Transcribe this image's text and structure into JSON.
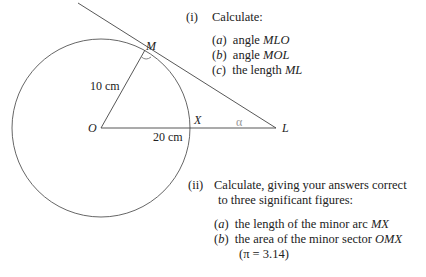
{
  "diagram": {
    "points": {
      "O": "O",
      "M": "M",
      "X": "X",
      "L": "L"
    },
    "labels": {
      "radius": "10 cm",
      "distance_OL": "20 cm",
      "angle_symbol": "α",
      "right_angle_at": "M"
    },
    "given": {
      "radius_cm": 10,
      "OL_cm": 20
    }
  },
  "part_i": {
    "number": "(i)",
    "instruction": "Calculate:",
    "items": [
      {
        "letter": "a",
        "text": "angle ",
        "emph": "MLO"
      },
      {
        "letter": "b",
        "text": "angle ",
        "emph": "MOL"
      },
      {
        "letter": "c",
        "text": "the length ",
        "emph": "ML"
      }
    ]
  },
  "part_ii": {
    "number": "(ii)",
    "instruction_line1": "Calculate, giving your answers correct",
    "instruction_line2": "to three significant figures:",
    "items": [
      {
        "letter": "a",
        "text": "the length of the minor arc ",
        "emph": "MX"
      },
      {
        "letter": "b",
        "text": "the area of the minor sector ",
        "emph": "OMX"
      }
    ],
    "note": "(π = 3.14)"
  }
}
